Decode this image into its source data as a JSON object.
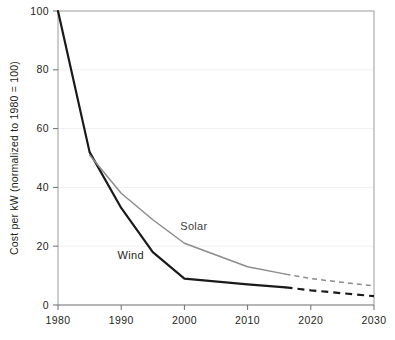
{
  "chart_data": {
    "type": "line",
    "title": "",
    "subtitle": "",
    "xlabel": "",
    "ylabel": "Cost per kW (normalized to 1980 = 100)",
    "xlim": [
      1980,
      2030
    ],
    "ylim": [
      0,
      100
    ],
    "xticks": [
      "1980",
      "1990",
      "2000",
      "2010",
      "2020",
      "2030"
    ],
    "xtick_values": [
      1980,
      1990,
      2000,
      2010,
      2020,
      2030
    ],
    "yticks": [
      "0",
      "20",
      "40",
      "60",
      "80",
      "100"
    ],
    "ytick_values": [
      0,
      20,
      40,
      60,
      80,
      100
    ],
    "grid": true,
    "grid_axis": "y",
    "legend": "inline-labels",
    "projection_start_year": 2016,
    "series": [
      {
        "name": "Wind",
        "color": "#1a1a1a",
        "linewidth": 2.2,
        "x": [
          1980,
          1985,
          1990,
          1995,
          2000,
          2010,
          2016
        ],
        "values": [
          100,
          52,
          33,
          18,
          9,
          7,
          6
        ],
        "projection_x": [
          2016,
          2020,
          2025,
          2030
        ],
        "projection_values": [
          6,
          5,
          4,
          3
        ],
        "label": "Wind",
        "label_x": 1991.5,
        "label_y": 15.5
      },
      {
        "name": "Solar",
        "color": "#8c8c8c",
        "linewidth": 1.5,
        "x": [
          1985,
          1990,
          1995,
          2000,
          2010,
          2016
        ],
        "values": [
          51,
          38,
          29,
          21,
          13,
          10.5
        ],
        "projection_x": [
          2016,
          2020,
          2025,
          2030
        ],
        "projection_values": [
          10.5,
          9,
          7.7,
          6.5
        ],
        "label": "Solar",
        "label_x": 2001.5,
        "label_y": 25.5
      }
    ]
  },
  "axes": {
    "y_axis_title": "Cost per kW (normalized to 1980 = 100)"
  },
  "style": {
    "background": "#ffffff",
    "grid_color": "#f0f0f0",
    "spine_color": "#9a9a9a",
    "tick_color": "#6d6d6d",
    "text_color": "#231f20",
    "wind_color": "#1a1a1a",
    "solar_color": "#8c8c8c"
  }
}
